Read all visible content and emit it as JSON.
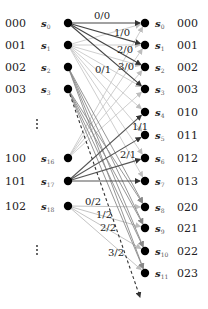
{
  "colors": {
    "node": "#000000",
    "edge_dark": "#444444",
    "edge_mid": "#8a8a8a",
    "edge_light": "#c4c4c4",
    "text": "#222222"
  },
  "left_nodes": [
    {
      "code": "000",
      "state": "s",
      "sub": "0",
      "x": 68,
      "y": 23
    },
    {
      "code": "001",
      "state": "s",
      "sub": "1",
      "x": 68,
      "y": 45
    },
    {
      "code": "002",
      "state": "s",
      "sub": "2",
      "x": 68,
      "y": 67
    },
    {
      "code": "003",
      "state": "s",
      "sub": "3",
      "x": 68,
      "y": 89
    },
    {
      "code": "100",
      "state": "s",
      "sub": "16",
      "x": 68,
      "y": 158
    },
    {
      "code": "101",
      "state": "s",
      "sub": "17",
      "x": 68,
      "y": 181
    },
    {
      "code": "102",
      "state": "s",
      "sub": "18",
      "x": 68,
      "y": 206
    }
  ],
  "right_nodes": [
    {
      "code": "000",
      "state": "s",
      "sub": "0",
      "x": 145,
      "y": 23
    },
    {
      "code": "001",
      "state": "s",
      "sub": "1",
      "x": 145,
      "y": 45
    },
    {
      "code": "002",
      "state": "s",
      "sub": "2",
      "x": 145,
      "y": 67
    },
    {
      "code": "003",
      "state": "s",
      "sub": "3",
      "x": 145,
      "y": 89
    },
    {
      "code": "010",
      "state": "s",
      "sub": "4",
      "x": 145,
      "y": 112
    },
    {
      "code": "011",
      "state": "s",
      "sub": "5",
      "x": 145,
      "y": 135
    },
    {
      "code": "012",
      "state": "s",
      "sub": "6",
      "x": 145,
      "y": 158
    },
    {
      "code": "013",
      "state": "s",
      "sub": "7",
      "x": 145,
      "y": 181
    },
    {
      "code": "020",
      "state": "s",
      "sub": "8",
      "x": 145,
      "y": 207
    },
    {
      "code": "021",
      "state": "s",
      "sub": "9",
      "x": 145,
      "y": 228
    },
    {
      "code": "022",
      "state": "s",
      "sub": "10",
      "x": 145,
      "y": 251
    },
    {
      "code": "023",
      "state": "s",
      "sub": "11",
      "x": 145,
      "y": 273
    }
  ],
  "ellipsis": [
    {
      "text": "⋮",
      "x": 37,
      "y": 124
    },
    {
      "text": "⋮",
      "x": 37,
      "y": 250
    }
  ],
  "edge_labels": [
    {
      "text": "0/0",
      "x": 94,
      "y": 19
    },
    {
      "text": "1/0",
      "x": 114,
      "y": 36
    },
    {
      "text": "2/0",
      "x": 117,
      "y": 53
    },
    {
      "text": "3/0",
      "x": 118,
      "y": 70
    },
    {
      "text": "0/1",
      "x": 95,
      "y": 73
    },
    {
      "text": "1/1",
      "x": 132,
      "y": 130
    },
    {
      "text": "2/1",
      "x": 120,
      "y": 158
    },
    {
      "text": "0/2",
      "x": 85,
      "y": 205
    },
    {
      "text": "1/2",
      "x": 96,
      "y": 218
    },
    {
      "text": "2/2",
      "x": 100,
      "y": 231
    },
    {
      "text": "3/2",
      "x": 108,
      "y": 256
    }
  ],
  "edges": {
    "dark_from_s0": [
      [
        0,
        0
      ],
      [
        0,
        1
      ],
      [
        0,
        2
      ],
      [
        0,
        3
      ]
    ],
    "dark_from_s17": [
      [
        5,
        4
      ],
      [
        5,
        5
      ],
      [
        5,
        6
      ],
      [
        5,
        7
      ]
    ],
    "light_from_s18": [
      [
        6,
        8
      ],
      [
        6,
        9
      ],
      [
        6,
        10
      ],
      [
        6,
        11
      ]
    ],
    "mid_from_s2_s3": [
      [
        2,
        8
      ],
      [
        2,
        9
      ],
      [
        2,
        10
      ],
      [
        2,
        11
      ],
      [
        3,
        8
      ],
      [
        3,
        9
      ],
      [
        3,
        10
      ],
      [
        3,
        11
      ]
    ],
    "light_from_s1": [
      [
        1,
        4
      ],
      [
        1,
        5
      ],
      [
        1,
        6
      ],
      [
        1,
        7
      ],
      [
        1,
        0
      ],
      [
        1,
        1
      ],
      [
        1,
        2
      ],
      [
        1,
        3
      ]
    ],
    "light_from_s16": [
      [
        4,
        0
      ],
      [
        4,
        1
      ],
      [
        4,
        2
      ],
      [
        4,
        3
      ]
    ]
  },
  "dashed_arrow": {
    "from": [
      68,
      89
    ],
    "to": [
      140,
      297
    ]
  }
}
